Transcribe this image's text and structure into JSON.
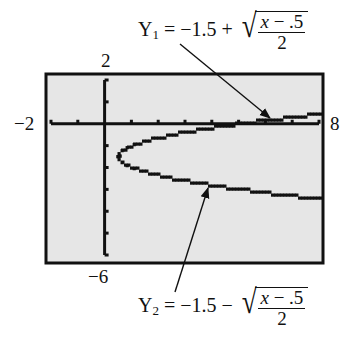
{
  "chart_data": {
    "type": "line",
    "title": "",
    "xlabel": "",
    "ylabel": "",
    "window": {
      "xmin": -2,
      "xmax": 8,
      "ymin": -6,
      "ymax": 2,
      "xscl": 1,
      "yscl": 1
    },
    "xlim": [
      -2,
      8
    ],
    "ylim": [
      -6,
      2
    ],
    "grid": false,
    "background": "#e6e6e6",
    "series": [
      {
        "name": "Y1",
        "equation": "Y1 = -1.5 + sqrt((x - .5)/2)",
        "domain": [
          0.5,
          8
        ],
        "x": [
          0.5,
          1,
          2,
          3,
          4,
          5,
          6,
          7,
          8
        ],
        "y": [
          -1.5,
          -1.0,
          -0.63,
          -0.38,
          -0.18,
          0.0,
          0.16,
          0.3,
          0.44
        ]
      },
      {
        "name": "Y2",
        "equation": "Y2 = -1.5 - sqrt((x - .5)/2)",
        "domain": [
          0.5,
          8
        ],
        "x": [
          0.5,
          1,
          2,
          3,
          4,
          5,
          6,
          7,
          8
        ],
        "y": [
          -1.5,
          -2.0,
          -2.37,
          -2.62,
          -2.82,
          -3.0,
          -3.16,
          -3.3,
          -3.44
        ]
      }
    ],
    "annotations": [
      {
        "text": "Y1 = -1.5 + sqrt((x - .5)/2)",
        "points_to": "upper branch"
      },
      {
        "text": "Y2 = -1.5 - sqrt((x - .5)/2)",
        "points_to": "lower branch"
      }
    ]
  },
  "labels": {
    "ymax": "2",
    "ymin": "−6",
    "xmin": "−2",
    "xmax": "8"
  },
  "eq1": {
    "lhs": "Y",
    "sub": "1",
    "rhs": " = −1.5 + ",
    "num_var": "x",
    "num_rest": " − .5",
    "den": "2"
  },
  "eq2": {
    "lhs": "Y",
    "sub": "2",
    "rhs": " = −1.5 − ",
    "num_var": "x",
    "num_rest": " − .5",
    "den": "2"
  }
}
